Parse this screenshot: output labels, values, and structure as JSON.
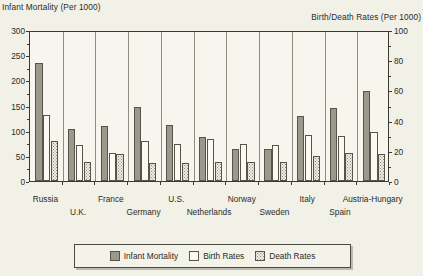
{
  "chart_data": {
    "type": "bar",
    "title": "",
    "left_axis_title": "Infant Mortality (Per 1000)",
    "right_axis_title": "Birth/Death Rates (Per 1000)",
    "xlabel": "",
    "grid": "vertical",
    "legend_position": "bottom",
    "categories": [
      "Russia",
      "U.K.",
      "France",
      "Germany",
      "U.S.",
      "Netherlands",
      "Norway",
      "Sweden",
      "Italy",
      "Spain",
      "Austria-Hungary"
    ],
    "left_axis": {
      "label": "Infant Mortality (Per 1000)",
      "ylim": [
        0,
        300
      ],
      "ticks": [
        0,
        50,
        100,
        150,
        200,
        250,
        300
      ],
      "tick_labels": [
        "0",
        "50",
        "100",
        "150",
        "200",
        "250",
        "300"
      ]
    },
    "right_axis": {
      "label": "Birth/Death Rates (Per 1000)",
      "ylim": [
        0,
        100
      ],
      "ticks": [
        0,
        20,
        40,
        60,
        80,
        100
      ],
      "tick_labels": [
        "0",
        "20",
        "40",
        "60",
        "80",
        "100"
      ]
    },
    "series": [
      {
        "name": "Infant Mortality",
        "axis": "left",
        "color": "#9a9a8c",
        "fill": "solid-gray",
        "values": [
          237,
          105,
          110,
          150,
          112,
          88,
          65,
          65,
          130,
          148,
          182
        ]
      },
      {
        "name": "Birth Rates",
        "axis": "right",
        "color": "#fbfaf2",
        "fill": "white",
        "values": [
          44,
          24,
          19,
          27,
          25,
          28,
          25,
          24,
          31,
          30,
          33
        ]
      },
      {
        "name": "Death Rates",
        "axis": "right",
        "color": "#efeee4",
        "fill": "dotted",
        "values": [
          27,
          13,
          18,
          12,
          12,
          13,
          13,
          13,
          17,
          19,
          18
        ]
      }
    ]
  },
  "legend": {
    "items": [
      {
        "label": "Infant Mortality",
        "swatch": "solid-gray"
      },
      {
        "label": "Birth Rates",
        "swatch": "white"
      },
      {
        "label": "Death Rates",
        "swatch": "dotted"
      }
    ]
  }
}
